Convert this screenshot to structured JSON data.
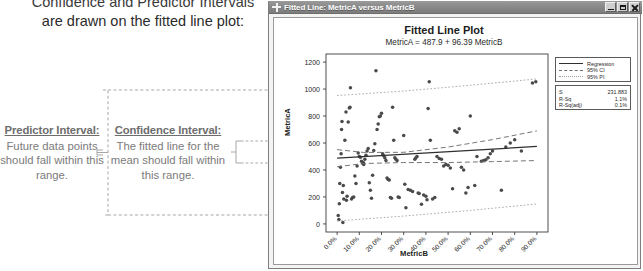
{
  "document": {
    "heading_line1": "Confidence and Predictor Intervals",
    "heading_line2": "are drawn on the fitted line plot:",
    "callouts": [
      {
        "id": "predictor-interval",
        "title": "Predictor Interval:",
        "body": "Future data points should fall within this range."
      },
      {
        "id": "confidence-interval",
        "title": "Confidence Interval:",
        "body": "The fitted line for the mean should fall within this range."
      }
    ]
  },
  "window": {
    "title": "Fitted Line: MetricA versus MetricB",
    "icon": "plus-graph-icon",
    "buttons": {
      "minimize": "Minimize",
      "maximize": "Restore",
      "close": "Close"
    }
  },
  "legend": {
    "entries": [
      {
        "label": "Regression",
        "style": "solid"
      },
      {
        "label": "95% CI",
        "style": "dashed"
      },
      {
        "label": "95% PI",
        "style": "dotted"
      }
    ]
  },
  "stats": {
    "rows": [
      {
        "key": "S",
        "value": "231.883"
      },
      {
        "key": "R-Sq",
        "value": "1.1%"
      },
      {
        "key": "R-Sq(adj)",
        "value": "0.1%"
      }
    ]
  },
  "colors": {
    "regression_line": "#2f2f2f",
    "ci_band": "#6f6f6f",
    "pi_band": "#9a9a9a",
    "point": "#4a4a4a",
    "titlebar": "#8a8a8a"
  },
  "chart_data": {
    "type": "scatter",
    "title": "Fitted Line Plot",
    "subtitle": "MetricA =  487.9 + 96.39 MetricB",
    "xlabel": "MetricB",
    "ylabel": "MetricA",
    "xlim": [
      -0.05,
      0.95
    ],
    "ylim": [
      -60,
      1260
    ],
    "xticks": [
      "0.0%",
      "10.0%",
      "20.0%",
      "30.0%",
      "40.0%",
      "50.0%",
      "60.0%",
      "70.0%",
      "80.0%",
      "90.0%"
    ],
    "xtick_values": [
      0,
      0.1,
      0.2,
      0.3,
      0.4,
      0.5,
      0.6,
      0.7,
      0.8,
      0.9
    ],
    "yticks": [
      "0",
      "200",
      "400",
      "600",
      "800",
      "1000",
      "1200"
    ],
    "ytick_values": [
      0,
      200,
      400,
      600,
      800,
      1000,
      1200
    ],
    "grid": false,
    "legend_position": "upper-right-outside",
    "fit": {
      "intercept": 487.9,
      "slope": 96.39,
      "s": 231.883,
      "r_sq": 0.011,
      "r_sq_adj": 0.001
    },
    "series": [
      {
        "name": "Regression",
        "type": "line",
        "style": "solid",
        "points": [
          [
            0.0,
            487.9
          ],
          [
            0.9,
            574.6
          ]
        ]
      },
      {
        "name": "95% CI upper",
        "type": "line",
        "style": "dashed",
        "points": [
          [
            0.0,
            551.0
          ],
          [
            0.12,
            530.0
          ],
          [
            0.3,
            531.0
          ],
          [
            0.5,
            570.0
          ],
          [
            0.7,
            625.0
          ],
          [
            0.9,
            690.0
          ]
        ]
      },
      {
        "name": "95% CI lower",
        "type": "line",
        "style": "dashed",
        "points": [
          [
            0.0,
            424.0
          ],
          [
            0.12,
            448.0
          ],
          [
            0.3,
            455.0
          ],
          [
            0.5,
            455.0
          ],
          [
            0.7,
            462.0
          ],
          [
            0.9,
            470.0
          ]
        ]
      },
      {
        "name": "95% PI upper",
        "type": "line",
        "style": "dotted",
        "points": [
          [
            0.0,
            952.0
          ],
          [
            0.3,
            985.0
          ],
          [
            0.6,
            1028.0
          ],
          [
            0.9,
            1075.0
          ]
        ]
      },
      {
        "name": "95% PI lower",
        "type": "line",
        "style": "dotted",
        "points": [
          [
            0.0,
            22.0
          ],
          [
            0.3,
            58.0
          ],
          [
            0.6,
            100.0
          ],
          [
            0.9,
            148.0
          ]
        ]
      },
      {
        "name": "Observations",
        "type": "scatter",
        "points": [
          [
            0.005,
            63
          ],
          [
            0.008,
            32
          ],
          [
            0.01,
            150
          ],
          [
            0.012,
            300
          ],
          [
            0.015,
            420
          ],
          [
            0.018,
            520
          ],
          [
            0.02,
            700
          ],
          [
            0.022,
            760
          ],
          [
            0.024,
            232
          ],
          [
            0.026,
            10
          ],
          [
            0.028,
            285
          ],
          [
            0.03,
            185
          ],
          [
            0.035,
            620
          ],
          [
            0.04,
            830
          ],
          [
            0.042,
            175
          ],
          [
            0.045,
            205
          ],
          [
            0.05,
            755
          ],
          [
            0.055,
            860
          ],
          [
            0.058,
            865
          ],
          [
            0.06,
            1010
          ],
          [
            0.065,
            185
          ],
          [
            0.07,
            195
          ],
          [
            0.075,
            200
          ],
          [
            0.08,
            355
          ],
          [
            0.085,
            300
          ],
          [
            0.09,
            430
          ],
          [
            0.095,
            525
          ],
          [
            0.1,
            500
          ],
          [
            0.105,
            495
          ],
          [
            0.11,
            465
          ],
          [
            0.115,
            450
          ],
          [
            0.118,
            455
          ],
          [
            0.12,
            440
          ],
          [
            0.125,
            480
          ],
          [
            0.13,
            510
          ],
          [
            0.135,
            540
          ],
          [
            0.14,
            560
          ],
          [
            0.145,
            305
          ],
          [
            0.15,
            250
          ],
          [
            0.155,
            190
          ],
          [
            0.16,
            360
          ],
          [
            0.165,
            545
          ],
          [
            0.17,
            595
          ],
          [
            0.175,
            1135
          ],
          [
            0.18,
            700
          ],
          [
            0.185,
            740
          ],
          [
            0.19,
            795
          ],
          [
            0.195,
            800
          ],
          [
            0.2,
            820
          ],
          [
            0.205,
            520
          ],
          [
            0.21,
            505
          ],
          [
            0.215,
            490
          ],
          [
            0.22,
            470
          ],
          [
            0.225,
            340
          ],
          [
            0.23,
            330
          ],
          [
            0.235,
            325
          ],
          [
            0.24,
            195
          ],
          [
            0.245,
            190
          ],
          [
            0.25,
            865
          ],
          [
            0.255,
            620
          ],
          [
            0.26,
            490
          ],
          [
            0.265,
            480
          ],
          [
            0.27,
            470
          ],
          [
            0.275,
            200
          ],
          [
            0.28,
            195
          ],
          [
            0.3,
            655
          ],
          [
            0.305,
            295
          ],
          [
            0.31,
            120
          ],
          [
            0.32,
            255
          ],
          [
            0.33,
            250
          ],
          [
            0.34,
            240
          ],
          [
            0.35,
            480
          ],
          [
            0.355,
            490
          ],
          [
            0.36,
            500
          ],
          [
            0.365,
            230
          ],
          [
            0.37,
            225
          ],
          [
            0.38,
            145
          ],
          [
            0.39,
            215
          ],
          [
            0.4,
            205
          ],
          [
            0.405,
            180
          ],
          [
            0.41,
            855
          ],
          [
            0.415,
            1055
          ],
          [
            0.42,
            620
          ],
          [
            0.43,
            185
          ],
          [
            0.44,
            195
          ],
          [
            0.45,
            500
          ],
          [
            0.46,
            485
          ],
          [
            0.47,
            480
          ],
          [
            0.48,
            430
          ],
          [
            0.49,
            440
          ],
          [
            0.5,
            435
          ],
          [
            0.51,
            415
          ],
          [
            0.52,
            260
          ],
          [
            0.53,
            690
          ],
          [
            0.54,
            680
          ],
          [
            0.55,
            705
          ],
          [
            0.56,
            420
          ],
          [
            0.57,
            400
          ],
          [
            0.58,
            230
          ],
          [
            0.59,
            270
          ],
          [
            0.6,
            800
          ],
          [
            0.62,
            285
          ],
          [
            0.63,
            500
          ],
          [
            0.65,
            465
          ],
          [
            0.66,
            470
          ],
          [
            0.67,
            475
          ],
          [
            0.68,
            490
          ],
          [
            0.69,
            520
          ],
          [
            0.7,
            540
          ],
          [
            0.74,
            250
          ],
          [
            0.76,
            570
          ],
          [
            0.78,
            600
          ],
          [
            0.8,
            625
          ],
          [
            0.83,
            540
          ],
          [
            0.88,
            1045
          ],
          [
            0.895,
            1055
          ]
        ]
      }
    ]
  }
}
